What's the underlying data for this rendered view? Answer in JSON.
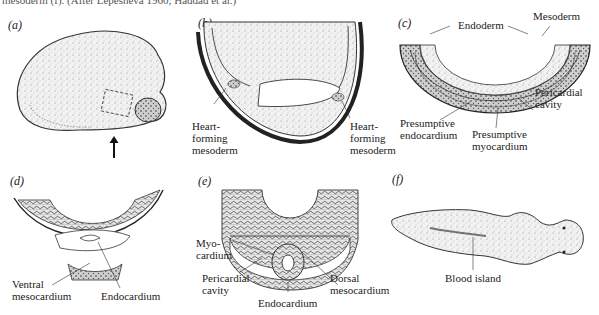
{
  "figure": {
    "caption_fragment": "mesoderm (f). (After Lepesheva 1960; Haddad et al.)",
    "panels": [
      {
        "id": "a",
        "label": "(a)",
        "subject": "whole embryo with boxed region and arrow",
        "annotations": []
      },
      {
        "id": "b",
        "label": "(b)",
        "annotations": [
          {
            "text_lines": [
              "Heart-",
              "forming",
              "mesoderm"
            ],
            "side": "left"
          },
          {
            "text_lines": [
              "Heart-",
              "forming",
              "mesoderm"
            ],
            "side": "right"
          }
        ]
      },
      {
        "id": "c",
        "label": "(c)",
        "annotations": [
          {
            "text": "Endoderm"
          },
          {
            "text": "Mesoderm"
          },
          {
            "text_lines": [
              "Pericardial",
              "cavity"
            ]
          },
          {
            "text_lines": [
              "Presumptive",
              "endocardium"
            ]
          },
          {
            "text_lines": [
              "Presumptive",
              "myocardium"
            ]
          }
        ]
      },
      {
        "id": "d",
        "label": "(d)",
        "annotations": [
          {
            "text_lines": [
              "Ventral",
              "mesocardium"
            ]
          },
          {
            "text": "Endocardium"
          }
        ]
      },
      {
        "id": "e",
        "label": "(e)",
        "annotations": [
          {
            "text_lines": [
              "Myo-",
              "cardium"
            ]
          },
          {
            "text_lines": [
              "Pericardial",
              "cavity"
            ]
          },
          {
            "text": "Endocardium"
          },
          {
            "text_lines": [
              "Dorsal",
              "mesocardium"
            ]
          }
        ]
      },
      {
        "id": "f",
        "label": "(f)",
        "annotations": [
          {
            "text": "Blood island"
          }
        ]
      }
    ]
  },
  "labels": {
    "a": "(a)",
    "b": "(b)",
    "c": "(c)",
    "d": "(d)",
    "e": "(e)",
    "f": "(f)",
    "b_left_1": "Heart-",
    "b_left_2": "forming",
    "b_left_3": "mesoderm",
    "b_right_1": "Heart-",
    "b_right_2": "forming",
    "b_right_3": "mesoderm",
    "c_endoderm": "Endoderm",
    "c_mesoderm": "Mesoderm",
    "c_pericardial_1": "Pericardial",
    "c_pericardial_2": "cavity",
    "c_endo_1": "Presumptive",
    "c_endo_2": "endocardium",
    "c_myo_1": "Presumptive",
    "c_myo_2": "myocardium",
    "d_ventral_1": "Ventral",
    "d_ventral_2": "mesocardium",
    "d_endocardium": "Endocardium",
    "e_myo_1": "Myo-",
    "e_myo_2": "cardium",
    "e_peri_1": "Pericardial",
    "e_peri_2": "cavity",
    "e_endocardium": "Endocardium",
    "e_dorsal_1": "Dorsal",
    "e_dorsal_2": "mesocardium",
    "f_blood_island": "Blood island"
  }
}
